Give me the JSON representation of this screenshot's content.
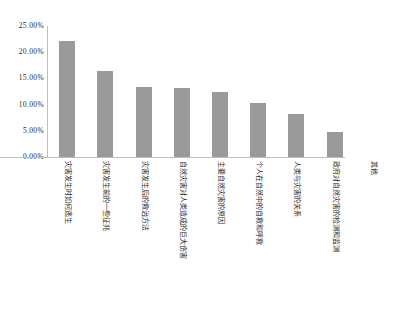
{
  "chart_data": {
    "type": "bar",
    "title": "",
    "subtitle": "",
    "xlabel": "",
    "ylabel": "",
    "ylim": [
      0,
      25
    ],
    "grid": false,
    "legend": false,
    "legend_position": "none",
    "bar_color": "#9a9a9a",
    "axis_color": "#bfbfbf",
    "text_color": "#2b2b2b",
    "y_tick_labels": [
      "25.00%",
      "20.00%",
      "15.00%",
      "10.00%",
      "5.00%",
      "0.00%"
    ],
    "y_tick_values": [
      25,
      20,
      15,
      10,
      5,
      0
    ],
    "categories": [
      "灾害发生时如何逃生",
      "灾害发生前的一些征兆",
      "灾害发生后的救治方法",
      "自然灾害对人类造成的巨大伤害",
      "主要自然灾害的原因",
      "个人在自然中的自救和呼救",
      "人类与灾害的关系",
      "政府对自然灾害的检测和监测",
      "其他"
    ],
    "values": [
      22.2,
      16.5,
      13.3,
      13.2,
      12.4,
      10.3,
      8.3,
      4.7,
      0.0
    ],
    "value_labels": [
      "22.20%",
      "16.50%",
      "13.30%",
      "13.20%",
      "12.40%",
      "10.30%",
      "8.30%",
      "4.70%",
      "0.00%"
    ]
  }
}
